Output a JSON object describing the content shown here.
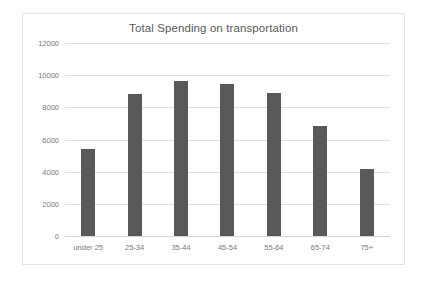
{
  "chart_data": {
    "type": "bar",
    "title": "Total Spending on transportation",
    "xlabel": "",
    "ylabel": "",
    "categories": [
      "under 25",
      "25-34",
      "35-44",
      "45-54",
      "55-64",
      "65-74",
      "75+"
    ],
    "values": [
      5400,
      8800,
      9650,
      9450,
      8900,
      6850,
      4150
    ],
    "ylim": [
      0,
      12000
    ],
    "yticks": [
      0,
      2000,
      4000,
      6000,
      8000,
      10000,
      12000
    ],
    "ytick_labels": [
      "0",
      "2000",
      "4000",
      "6000",
      "8000",
      "10000",
      "12000"
    ],
    "grid": true,
    "legend": false,
    "series_color": "#595959",
    "gridline_color": "#e0e0e0",
    "title_color": "#5a5a5a",
    "axis_text_color": "#7a7a7a",
    "frame_color": "#e3e3e3",
    "background": "#ffffff"
  }
}
